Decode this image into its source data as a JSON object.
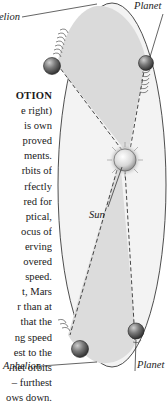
{
  "labels": {
    "aphelion_top": "Aphelion",
    "planet_top": "Planet",
    "sun": "Sun",
    "aphelion_bottom": "Aphelion",
    "planet_bottom": "Planet"
  },
  "text_block": {
    "lines": [
      "OTION",
      "e right)",
      "is own",
      "proved",
      "ments.",
      "rbits of",
      "rfectly",
      "red for",
      "ptical,",
      "ocus of",
      "erving",
      "overed",
      "speed.",
      "t, Mars",
      "r than at",
      "that the",
      "ng speed",
      "est to the",
      "net orbits",
      "– furthest",
      "ows down."
    ]
  },
  "colors": {
    "ellipse_fill": "#f1f1f1",
    "sector_fill": "#dedede",
    "outline": "#333333",
    "planet_dark": "#3a3a3a",
    "planet_light": "#a8a8a8"
  }
}
